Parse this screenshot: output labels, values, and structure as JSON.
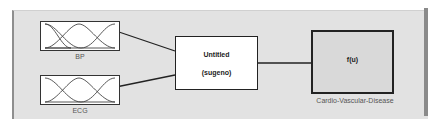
{
  "diagram": {
    "type": "fuzzy-inference-system",
    "inputs": [
      {
        "name": "BP"
      },
      {
        "name": "ECG"
      }
    ],
    "system": {
      "title": "Untitled",
      "type": "(sugeno)"
    },
    "output": {
      "function": "f(u)",
      "name": "Cardio-Vascular-Disease"
    }
  },
  "colors": {
    "panel_bg": "#e2e2e2",
    "line": "#222222",
    "label": "#555555"
  }
}
